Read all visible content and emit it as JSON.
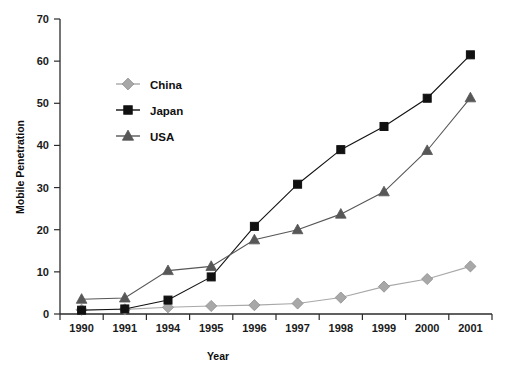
{
  "chart_data": {
    "type": "line",
    "title": "",
    "xlabel": "Year",
    "ylabel": "Mobile Penetration",
    "categories": [
      "1990",
      "1991",
      "1994",
      "1995",
      "1996",
      "1997",
      "1998",
      "1999",
      "2000",
      "2001"
    ],
    "xtick_labels": [
      "1990",
      "1991",
      "1994",
      "1995",
      "1996",
      "1997",
      "1998",
      "1999",
      "2000",
      "2001"
    ],
    "ytick_labels": [
      "0",
      "10",
      "20",
      "30",
      "40",
      "50",
      "60",
      "70"
    ],
    "yticks": [
      0,
      10,
      20,
      30,
      40,
      50,
      60,
      70
    ],
    "ylim": [
      0,
      70
    ],
    "grid": false,
    "legend_position": "upper-left-inside",
    "series": [
      {
        "name": "China",
        "color": "#a8a8a8",
        "marker": "diamond",
        "values": [
          1.0,
          1.1,
          1.6,
          1.9,
          2.1,
          2.5,
          3.9,
          6.5,
          8.3,
          11.3
        ]
      },
      {
        "name": "Japan",
        "color": "#111111",
        "marker": "square",
        "values": [
          0.9,
          1.2,
          3.3,
          8.8,
          20.8,
          30.8,
          39.0,
          44.5,
          51.2,
          61.5
        ]
      },
      {
        "name": "USA",
        "color": "#575757",
        "marker": "triangle",
        "values": [
          3.5,
          3.8,
          10.3,
          11.3,
          17.6,
          20.0,
          23.7,
          29.0,
          38.8,
          51.3
        ]
      }
    ]
  }
}
